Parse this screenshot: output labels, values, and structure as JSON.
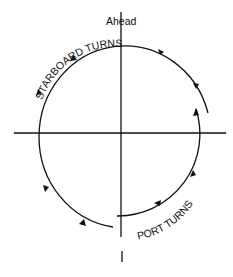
{
  "diagram": {
    "labels": {
      "ahead": "Ahead",
      "starboard": "STARBOARD TURNS",
      "port": "PORT TURNS"
    },
    "colors": {
      "line": "#111111",
      "background": "#ffffff"
    }
  }
}
